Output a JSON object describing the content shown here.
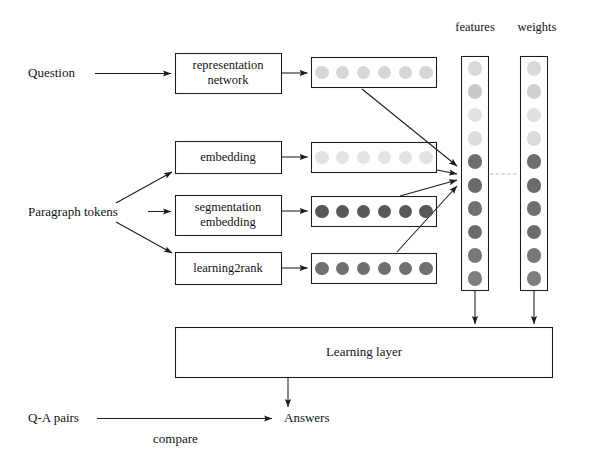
{
  "diagram": {
    "inputs": [
      {
        "id": "question",
        "label": "Question"
      },
      {
        "id": "paragraph-tokens",
        "label": "Paragraph tokens"
      },
      {
        "id": "qa-pairs",
        "label": "Q-A pairs"
      }
    ],
    "modules": [
      {
        "id": "representation-network",
        "label": "representation\nnetwork",
        "line1": "representation",
        "line2": "network"
      },
      {
        "id": "embedding",
        "label": "embedding",
        "line1": "embedding",
        "line2": ""
      },
      {
        "id": "segmentation-embedding",
        "label": "segmentation\nembedding",
        "line1": "segmentation",
        "line2": "embedding"
      },
      {
        "id": "learning2rank",
        "label": "learning2rank",
        "line1": "learning2rank",
        "line2": ""
      }
    ],
    "learning_layer": {
      "label": "Learning layer"
    },
    "output": {
      "label": "Answers"
    },
    "edge_labels": [
      {
        "id": "compare",
        "label": "compare"
      }
    ],
    "columns": [
      {
        "id": "features",
        "header": "features",
        "count": 10,
        "shades": [
          "#d9d9d9",
          "#c9c9c9",
          "#e2e2e2",
          "#dcdcdc",
          "#6e6e6e",
          "#6b6b6b",
          "#717171",
          "#6c6c6c",
          "#787878",
          "#7e7e7e"
        ]
      },
      {
        "id": "weights",
        "header": "weights",
        "count": 10,
        "shades": [
          "#d9d9d9",
          "#cfcfcf",
          "#e0e0e0",
          "#dadada",
          "#6e6e6e",
          "#6b6b6b",
          "#717171",
          "#6c6c6c",
          "#787878",
          "#7e7e7e"
        ]
      }
    ],
    "token_rows": [
      {
        "id": "question-tokens",
        "count": 6,
        "shade": "#d6d6d6",
        "source": "representation-network"
      },
      {
        "id": "embedding-tokens",
        "count": 6,
        "shade": "#e3e3e3",
        "source": "embedding"
      },
      {
        "id": "segmentation-tokens",
        "count": 6,
        "shade": "#585858",
        "source": "segmentation-embedding"
      },
      {
        "id": "learning2rank-tokens",
        "count": 6,
        "shade": "#6f6f6f",
        "source": "learning2rank"
      }
    ],
    "colors": {
      "stroke": "#1c1c1c",
      "background": "#ffffff",
      "dashed_connector": "#b9b9b9",
      "text": "#131313"
    }
  }
}
